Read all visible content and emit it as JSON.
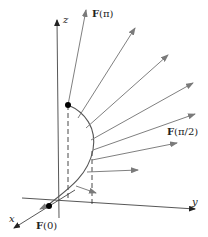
{
  "diagram": {
    "axes": {
      "x_label": "x",
      "y_label": "y",
      "z_label": "z"
    },
    "labels": {
      "f_pi": "F(π)",
      "f_pi_half": "F(π/2)",
      "f_zero": "F(0)"
    },
    "colors": {
      "axis": "#333333",
      "curve": "#555555",
      "vector": "#808080",
      "point": "#000000"
    }
  }
}
